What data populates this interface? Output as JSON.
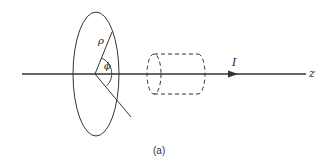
{
  "figure": {
    "caption": "(a)",
    "labels": {
      "rho": "ρ",
      "phi": "ϕ",
      "current": "I",
      "axis": "z"
    },
    "colors": {
      "stroke": "#333333",
      "background": "#ffffff"
    }
  }
}
